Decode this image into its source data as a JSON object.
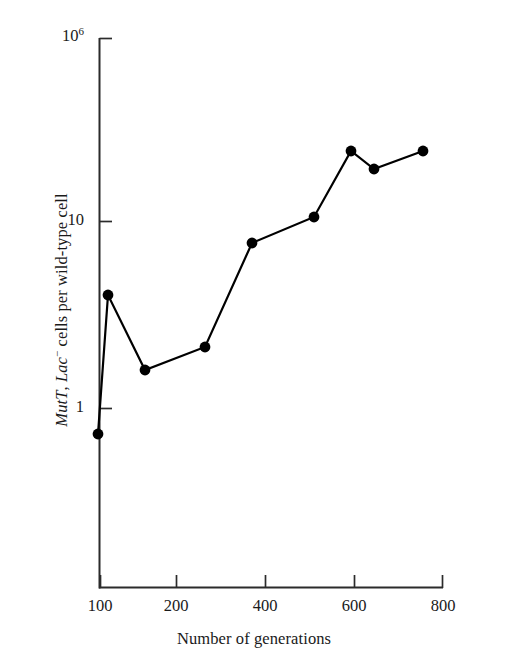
{
  "chart_data": {
    "type": "line",
    "title": "",
    "xlabel": "Number of generations",
    "ylabel_parts": {
      "italic1": "MutT",
      "sep": ", ",
      "italic2": "Lac",
      "superscript": "−",
      "rest": " cells per wild-type cell"
    },
    "ylabel": "MutT, Lac− cells per wild-type cell",
    "xticks": [
      100,
      200,
      400,
      600,
      800
    ],
    "xtick_labels": [
      "100",
      "200",
      "400",
      "600",
      "800"
    ],
    "yticks": [
      1,
      10,
      1000000
    ],
    "ytick_labels": [
      "1",
      "10",
      "10⁶"
    ],
    "ytick_label_top_base": "10",
    "ytick_label_top_exp": "6",
    "yscale": "log",
    "xscale": "linear",
    "grid": false,
    "legend": null,
    "series": [
      {
        "name": "MutT, Lac- cells per wild-type cell",
        "x": [
          100,
          110,
          135,
          190,
          245,
          310,
          355,
          380,
          445
        ],
        "y": [
          0.7,
          4.0,
          1.6,
          2.1,
          7.8,
          11.0,
          25.0,
          20.0,
          25.0
        ],
        "marker": "filled-circle",
        "color": "#000000",
        "linewidth": 2.2,
        "markersize": 5.4
      }
    ],
    "pixel_geometry": {
      "note": "positions read off the screenshot",
      "points_px": [
        [
          98,
          434
        ],
        [
          108,
          295
        ],
        [
          145,
          370
        ],
        [
          205,
          347
        ],
        [
          252,
          243
        ],
        [
          314,
          217
        ],
        [
          351,
          151
        ],
        [
          374,
          169
        ],
        [
          423,
          151
        ]
      ],
      "xtick_px": [
        100,
        176,
        265,
        354,
        443
      ],
      "ytick_px": [
        [
          38,
          "10⁶"
        ],
        [
          221,
          "10"
        ],
        [
          408,
          "1"
        ]
      ],
      "axis_left_px": 99,
      "axis_bottom_px": 588,
      "axis_top_px": 38,
      "axis_right_px": 443
    }
  }
}
